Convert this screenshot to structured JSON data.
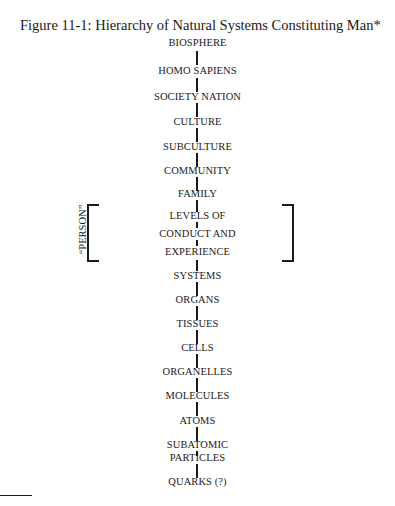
{
  "figure": {
    "title": "Figure 11-1:  Hierarchy of Natural Systems Constituting Man*",
    "levels": [
      "BIOSPHERE",
      "HOMO SAPIENS",
      "SOCIETY NATION",
      "CULTURE",
      "SUBCULTURE",
      "COMMUNITY",
      "FAMILY",
      "LEVELS OF",
      "CONDUCT AND",
      "EXPERIENCE",
      "SYSTEMS",
      "ORGANS",
      "TISSUES",
      "CELLS",
      "ORGANELLES",
      "MOLECULES",
      "ATOMS",
      "SUBATOMIC",
      "PARTICLES",
      "QUARKS (?)"
    ],
    "bracket_label": "“PERSON”"
  }
}
